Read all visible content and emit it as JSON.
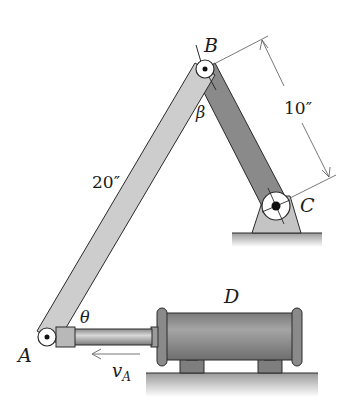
{
  "diagram": {
    "type": "mechanism",
    "points": {
      "A": {
        "label": "A",
        "x": 47,
        "y": 337
      },
      "B": {
        "label": "B",
        "x": 205,
        "y": 69
      },
      "C": {
        "label": "C",
        "x": 276,
        "y": 206
      }
    },
    "labels": {
      "A": "A",
      "B": "B",
      "C": "C",
      "D": "D",
      "theta": "θ",
      "beta": "β",
      "vA_main": "v",
      "vA_sub": "A"
    },
    "dimensions": {
      "AB": "20″",
      "BC": "10″"
    },
    "colors": {
      "link_AB": "#c9c9c9",
      "link_BC": "#8a8a8a",
      "cylinder": "#8e8e8e",
      "ground": "#bdbdbd",
      "bracket": "#c4c4c4",
      "outline": "#2a2a2a"
    }
  }
}
